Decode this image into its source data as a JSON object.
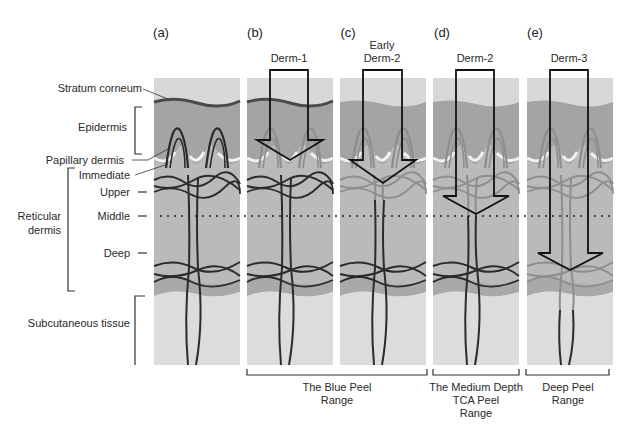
{
  "panels": [
    {
      "letter": "(a)",
      "peel": ""
    },
    {
      "letter": "(b)",
      "peel": "Derm-1"
    },
    {
      "letter": "(c)",
      "peel_line1": "Early",
      "peel_line2": "Derm-2"
    },
    {
      "letter": "(d)",
      "peel": "Derm-2"
    },
    {
      "letter": "(e)",
      "peel": "Derm-3"
    }
  ],
  "layers": {
    "stratum_corneum": "Stratum corneum",
    "epidermis": "Epidermis",
    "papillary_dermis": "Papillary dermis",
    "immediate": "Immediate",
    "upper": "Upper",
    "middle": "Middle",
    "deep": "Deep",
    "reticular_line1": "Reticular",
    "reticular_line2": "dermis",
    "subcutaneous": "Subcutaneous tissue"
  },
  "ranges": [
    {
      "line1": "The Blue Peel",
      "line2": "Range"
    },
    {
      "line1": "The Medium Depth",
      "line2": "TCA Peel",
      "line3": "Range"
    },
    {
      "line1": "Deep Peel",
      "line2": "Range"
    }
  ],
  "colors": {
    "background": "#ffffff",
    "surface": "#d9d9d9",
    "epidermis": "#a3a3a3",
    "dermis": "#b9b9b9",
    "subcutaneous": "#dcdcdc",
    "vessel_dark": "#2b2b2b",
    "vessel_faded": "#8e8e8e",
    "arrow": "#111111"
  }
}
